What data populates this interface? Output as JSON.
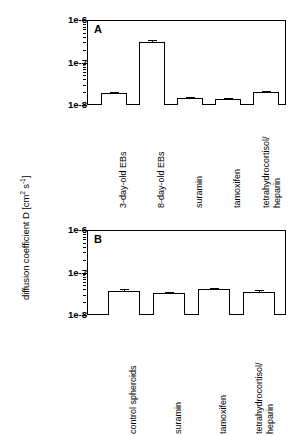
{
  "figure": {
    "y_axis_title_main": "diffusion coefficient D [cm",
    "y_axis_title_sup1": "2",
    "y_axis_title_mid": " s",
    "y_axis_title_sup2": "-1",
    "y_axis_title_end": "]",
    "y_axis_title_plain": "diffusion coefficient D [cm2 s-1]"
  },
  "panels": {
    "a": {
      "letter": "A"
    },
    "b": {
      "letter": "B"
    }
  },
  "ticks": {
    "labels": [
      "1e-6",
      "1e-7",
      "1e-8"
    ]
  },
  "chart_data": [
    {
      "type": "bar",
      "title": "A",
      "xlabel": "",
      "ylabel": "diffusion coefficient D [cm2 s-1]",
      "yscale": "log",
      "ylim": [
        1e-08,
        1e-06
      ],
      "ytick_labels": [
        "1e-6",
        "1e-7",
        "1e-8"
      ],
      "ytick_values": [
        1e-06,
        1e-07,
        1e-08
      ],
      "grid": false,
      "legend": "none",
      "categories": [
        "3-day-old EBs",
        "8-day-old EBs",
        "suramin",
        "tamoxifen",
        "tetrahydrocortisol/ heparin"
      ],
      "category_lines": [
        [
          "3-day-old EBs"
        ],
        [
          "8-day-old EBs"
        ],
        [
          "suramin"
        ],
        [
          "tamoxifen"
        ],
        [
          "tetrahydrocortisol/",
          "heparin"
        ]
      ],
      "values": [
        1.9e-08,
        3e-07,
        1.45e-08,
        1.4e-08,
        2e-08
      ],
      "errors": [
        1.5e-09,
        4e-08,
        8e-10,
        8e-10,
        1.5e-09
      ],
      "value_labels": [
        "1.9e-8",
        "3.0e-7",
        "1.45e-8",
        "1.4e-8",
        "2.0e-8"
      ]
    },
    {
      "type": "bar",
      "title": "B",
      "xlabel": "",
      "ylabel": "diffusion coefficient D [cm2 s-1]",
      "yscale": "log",
      "ylim": [
        1e-08,
        1e-06
      ],
      "ytick_labels": [
        "1e-6",
        "1e-7",
        "1e-8"
      ],
      "ytick_values": [
        1e-06,
        1e-07,
        1e-08
      ],
      "grid": false,
      "legend": "none",
      "categories": [
        "control spheroids",
        "suramin",
        "tamoxifen",
        "tetrahydrocortisol/ heparin"
      ],
      "category_lines": [
        [
          "control spheroids"
        ],
        [
          "suramin"
        ],
        [
          "tamoxifen"
        ],
        [
          "tetrahydrocortisol/",
          "heparin"
        ]
      ],
      "values": [
        3.6e-08,
        3.3e-08,
        4e-08,
        3.5e-08
      ],
      "errors": [
        4.5e-09,
        1.5e-09,
        2.5e-09,
        4e-09
      ],
      "value_labels": [
        "3.6e-8",
        "3.3e-8",
        "4.0e-8",
        "3.5e-8"
      ]
    }
  ]
}
